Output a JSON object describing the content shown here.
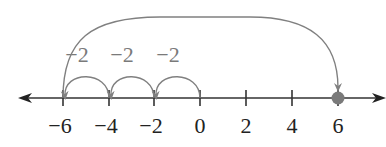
{
  "number_line": {
    "ticks": [
      {
        "value": -6,
        "label": "−6",
        "x": 63
      },
      {
        "value": -4,
        "label": "−4",
        "x": 109
      },
      {
        "value": -2,
        "label": "−2",
        "x": 154
      },
      {
        "value": 0,
        "label": "0",
        "x": 200
      },
      {
        "value": 2,
        "label": "2",
        "x": 246
      },
      {
        "value": 4,
        "label": "4",
        "x": 292
      },
      {
        "value": 6,
        "label": "6",
        "x": 338
      }
    ],
    "highlighted_point": {
      "value": 6,
      "color": "#7a7a7a"
    }
  },
  "hops": [
    {
      "label": "−2",
      "from": 0,
      "to": -2
    },
    {
      "label": "−2",
      "from": -2,
      "to": -4
    },
    {
      "label": "−2",
      "from": -4,
      "to": -6
    }
  ],
  "big_arc": {
    "from": -6,
    "to": 6
  },
  "colors": {
    "axis": "#333333",
    "arc": "#808080",
    "text": "#222222",
    "hop_text": "#7a7a7a"
  }
}
